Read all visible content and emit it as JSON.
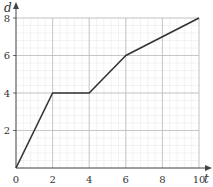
{
  "chart_data": {
    "type": "line",
    "title": "",
    "xlabel": "t",
    "ylabel": "d",
    "xlim": [
      0,
      10
    ],
    "ylim": [
      0,
      8
    ],
    "x_ticks": [
      0,
      2,
      4,
      6,
      8,
      10
    ],
    "y_ticks": [
      2,
      4,
      6,
      8
    ],
    "x_tick_labels": [
      "0",
      "2",
      "4",
      "6",
      "8",
      "10"
    ],
    "y_tick_labels": [
      "2",
      "4",
      "6",
      "8"
    ],
    "grid": true,
    "minor_grid": true,
    "legend": null,
    "series": [
      {
        "name": "d vs t",
        "x": [
          0,
          2,
          4,
          6,
          10
        ],
        "y": [
          0,
          4,
          4,
          6,
          8
        ]
      }
    ]
  },
  "colors": {
    "line": "#333333",
    "axis": "#444444",
    "major_grid": "#bbbbbb",
    "minor_grid": "#e6e6e6",
    "background": "#ffffff"
  }
}
